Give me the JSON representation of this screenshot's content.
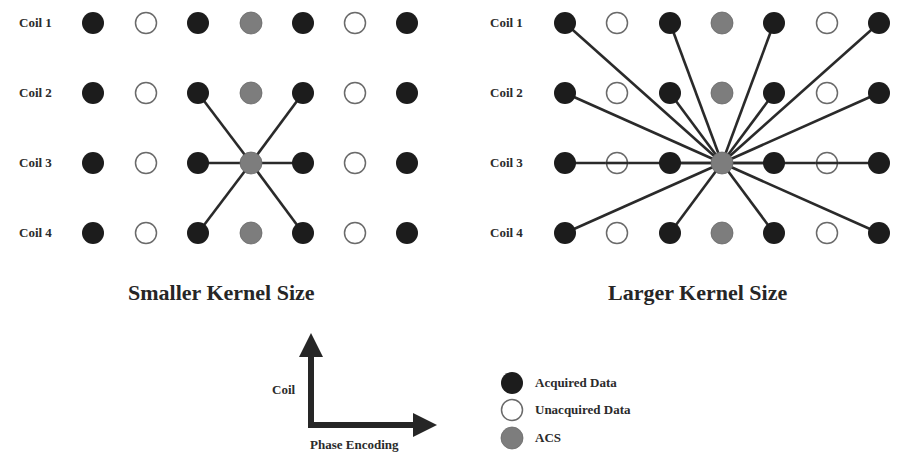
{
  "colors": {
    "acquired": "#1c1c1c",
    "unacquired": "#ffffff",
    "unacquired_stroke": "#6a6a6a",
    "acs": "#7d7d7d",
    "line": "#2a2a2a"
  },
  "rows": [
    "Coil 1",
    "Coil 2",
    "Coil 3",
    "Coil 4"
  ],
  "panels": [
    {
      "title": "Smaller Kernel Size",
      "grid": [
        [
          "acquired",
          "unacquired",
          "acquired",
          "acs",
          "acquired",
          "unacquired",
          "acquired"
        ],
        [
          "acquired",
          "unacquired",
          "acquired",
          "acs",
          "acquired",
          "unacquired",
          "acquired"
        ],
        [
          "acquired",
          "unacquired",
          "acquired",
          "acs",
          "acquired",
          "unacquired",
          "acquired"
        ],
        [
          "acquired",
          "unacquired",
          "acquired",
          "acs",
          "acquired",
          "unacquired",
          "acquired"
        ]
      ],
      "target": [
        2,
        3
      ],
      "connections": [
        [
          1,
          2
        ],
        [
          1,
          4
        ],
        [
          2,
          2
        ],
        [
          2,
          4
        ],
        [
          3,
          2
        ],
        [
          3,
          4
        ]
      ]
    },
    {
      "title": "Larger Kernel Size",
      "grid": [
        [
          "acquired",
          "unacquired",
          "acquired",
          "acs",
          "acquired",
          "unacquired",
          "acquired"
        ],
        [
          "acquired",
          "unacquired",
          "acquired",
          "acs",
          "acquired",
          "unacquired",
          "acquired"
        ],
        [
          "acquired",
          "unacquired",
          "acquired",
          "acs",
          "acquired",
          "unacquired",
          "acquired"
        ],
        [
          "acquired",
          "unacquired",
          "acquired",
          "acs",
          "acquired",
          "unacquired",
          "acquired"
        ]
      ],
      "target": [
        2,
        3
      ],
      "connections": [
        [
          0,
          0
        ],
        [
          0,
          2
        ],
        [
          0,
          4
        ],
        [
          0,
          6
        ],
        [
          1,
          0
        ],
        [
          1,
          2
        ],
        [
          1,
          4
        ],
        [
          1,
          6
        ],
        [
          2,
          0
        ],
        [
          2,
          2
        ],
        [
          2,
          4
        ],
        [
          2,
          6
        ],
        [
          3,
          0
        ],
        [
          3,
          2
        ],
        [
          3,
          4
        ],
        [
          3,
          6
        ]
      ]
    }
  ],
  "axes": {
    "y_label": "Coil",
    "x_label": "Phase Encoding"
  },
  "legend": [
    {
      "type": "acquired",
      "label": "Acquired Data"
    },
    {
      "type": "unacquired",
      "label": "Unacquired Data"
    },
    {
      "type": "acs",
      "label": "ACS"
    }
  ]
}
